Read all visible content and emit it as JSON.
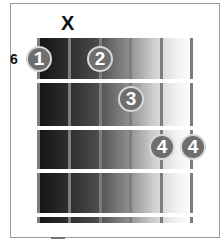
{
  "diagram": {
    "type": "guitar-chord-chart",
    "starting_fret_label": "6",
    "muted_marker": "X",
    "muted_string_index": 1,
    "strings": 6,
    "frets_shown": 4,
    "fingers": [
      {
        "label": "1",
        "string": 1,
        "fret": 1
      },
      {
        "label": "2",
        "string": 3,
        "fret": 1
      },
      {
        "label": "3",
        "string": 4,
        "fret": 2
      },
      {
        "label": "4",
        "string": 5,
        "fret": 3
      },
      {
        "label": "4",
        "string": 6,
        "fret": 3
      }
    ],
    "colors": {
      "dot": "#6e6e6e",
      "dot_border": "#d8d8d8",
      "string": "#7d7d7d",
      "fret": "#ffffff"
    }
  }
}
